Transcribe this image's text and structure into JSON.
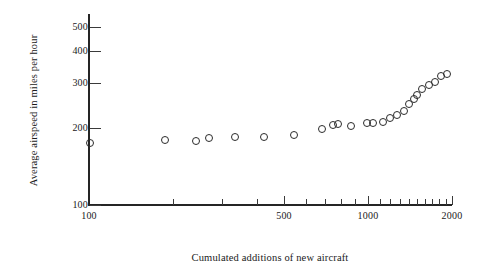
{
  "chart_data": {
    "type": "scatter",
    "title": "",
    "xlabel": "Cumulated additions of new aircraft",
    "ylabel": "Average airspeed in miles per hour",
    "xscale": "log",
    "yscale": "log",
    "xlim": [
      100,
      2000
    ],
    "ylim": [
      100,
      560
    ],
    "grid": false,
    "legend": "none",
    "marker": "open-circle",
    "marker_color": "#2b2b2b",
    "x_tick_labels": [
      "100",
      "500",
      "1000",
      "2000"
    ],
    "x_tick_values": [
      100,
      500,
      1000,
      2000
    ],
    "x_minor_ticks": [
      200,
      300,
      400,
      600,
      700,
      800,
      900,
      1100,
      1200,
      1300,
      1400,
      1500,
      1600,
      1700,
      1800,
      1900
    ],
    "y_tick_labels": [
      "100",
      "200",
      "300",
      "400",
      "500"
    ],
    "y_tick_values": [
      100,
      200,
      300,
      400,
      500
    ],
    "points": [
      {
        "x": 100,
        "y": 176
      },
      {
        "x": 186,
        "y": 181
      },
      {
        "x": 239,
        "y": 180
      },
      {
        "x": 268,
        "y": 184
      },
      {
        "x": 330,
        "y": 186
      },
      {
        "x": 420,
        "y": 187
      },
      {
        "x": 540,
        "y": 190
      },
      {
        "x": 680,
        "y": 200
      },
      {
        "x": 745,
        "y": 207
      },
      {
        "x": 775,
        "y": 209
      },
      {
        "x": 860,
        "y": 206
      },
      {
        "x": 980,
        "y": 211
      },
      {
        "x": 1030,
        "y": 212
      },
      {
        "x": 1120,
        "y": 214
      },
      {
        "x": 1190,
        "y": 222
      },
      {
        "x": 1260,
        "y": 228
      },
      {
        "x": 1330,
        "y": 236
      },
      {
        "x": 1390,
        "y": 250
      },
      {
        "x": 1450,
        "y": 262
      },
      {
        "x": 1480,
        "y": 272
      },
      {
        "x": 1550,
        "y": 286
      },
      {
        "x": 1640,
        "y": 298
      },
      {
        "x": 1720,
        "y": 305
      },
      {
        "x": 1810,
        "y": 322
      },
      {
        "x": 1900,
        "y": 330
      }
    ]
  }
}
